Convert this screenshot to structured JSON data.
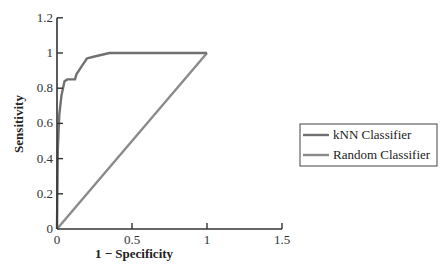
{
  "chart_data": {
    "type": "line",
    "title": "",
    "xlabel": "1 − Specificity",
    "ylabel": "Sensitivity",
    "xlim": [
      0,
      1.5
    ],
    "ylim": [
      0,
      1.2
    ],
    "xticks": [
      0,
      0.5,
      1,
      1.5
    ],
    "xtick_labels": [
      "0",
      "0.5",
      "1",
      "1.5"
    ],
    "yticks": [
      0,
      0.2,
      0.4,
      0.6,
      0.8,
      1,
      1.2
    ],
    "ytick_labels": [
      "0",
      "0.2",
      "0.4",
      "0.6",
      "0.8",
      "1",
      "1.2"
    ],
    "grid": false,
    "legend_position": "right",
    "series": [
      {
        "name": "kNN Classifier",
        "color": "#707070",
        "x": [
          0,
          0.005,
          0.015,
          0.03,
          0.05,
          0.07,
          0.12,
          0.13,
          0.2,
          0.25,
          0.35,
          1.0
        ],
        "y": [
          0,
          0.45,
          0.65,
          0.76,
          0.84,
          0.85,
          0.85,
          0.88,
          0.97,
          0.98,
          1.0,
          1.0
        ]
      },
      {
        "name": "Random Classifier",
        "color": "#8a8a8a",
        "x": [
          0,
          1
        ],
        "y": [
          0,
          1
        ]
      }
    ]
  }
}
